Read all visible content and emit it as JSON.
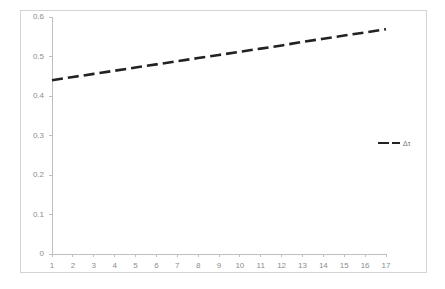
{
  "chart_data": {
    "type": "line",
    "title": "",
    "xlabel": "",
    "ylabel": "",
    "x": [
      1,
      2,
      3,
      4,
      5,
      6,
      7,
      8,
      9,
      10,
      11,
      12,
      13,
      14,
      15,
      16,
      17
    ],
    "series": [
      {
        "name": "Δτ",
        "values": [
          0.44,
          0.448,
          0.456,
          0.464,
          0.472,
          0.48,
          0.488,
          0.496,
          0.504,
          0.512,
          0.52,
          0.528,
          0.537,
          0.545,
          0.553,
          0.561,
          0.569
        ],
        "color": "#222222",
        "style": "dashed"
      }
    ],
    "xlim": [
      1,
      17
    ],
    "ylim": [
      0,
      0.6
    ],
    "x_tick_labels": [
      "1",
      "2",
      "3",
      "4",
      "5",
      "6",
      "7",
      "8",
      "9",
      "10",
      "11",
      "12",
      "13",
      "14",
      "15",
      "16",
      "17"
    ],
    "y_tick_labels": [
      "0",
      "0.1",
      "0.2",
      "0.3",
      "0.4",
      "0.5",
      "0.6"
    ],
    "y_tick_values": [
      0,
      0.1,
      0.2,
      0.3,
      0.4,
      0.5,
      0.6
    ],
    "grid": false,
    "legend": {
      "position": "right",
      "entries": [
        {
          "label": "Δτ",
          "color": "#222222",
          "style": "dashed"
        }
      ]
    },
    "axis_color": "#bfbfbf",
    "tick_label_color": "#8d8d8d",
    "plot_background": "#ffffff",
    "frame_color": "#d4d4d4"
  }
}
